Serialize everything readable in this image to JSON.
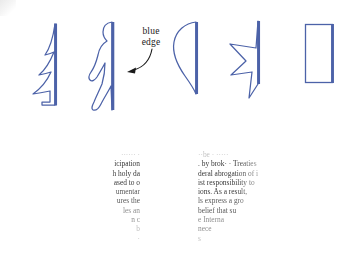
{
  "figure": {
    "accent_blue": "#4c62a8",
    "ink_black": "#222222",
    "background": "#ffffff",
    "annotation": {
      "line1": "blue",
      "line2": "edge",
      "pointer": "curved-arrow-left"
    },
    "shapes": [
      {
        "name": "fir-tree",
        "label": "fir tree silhouette with blue right edge",
        "edge_side": "right"
      },
      {
        "name": "human-figure",
        "label": "walking human silhouette with blue right edge",
        "edge_side": "right"
      },
      {
        "name": "teardrop-leaf",
        "label": "teardrop leaf shape with blue right edge",
        "edge_side": "right"
      },
      {
        "name": "half-star",
        "label": "half star shape with blue right edge",
        "edge_side": "right"
      },
      {
        "name": "rectangle",
        "label": "rectangle with blue right edge",
        "edge_side": "right"
      }
    ]
  },
  "text_panels": {
    "arrow": {
      "name": "right-arrow",
      "direction": "right"
    },
    "left": {
      "lines": [
        "······ ·",
        "icipation",
        "h holy da",
        "ased to o",
        "umentar",
        "ures the",
        "les an",
        "n c",
        "b",
        "·"
      ]
    },
    "right": {
      "lines": [
        "··be ·          ·····",
        ". by brok· · Treaties",
        "deral abrogation of i",
        "ist responsibility to",
        "ions. As a result,",
        "ls express a gro",
        "belief that su",
        "e Interna",
        "nece",
        "s"
      ]
    }
  }
}
